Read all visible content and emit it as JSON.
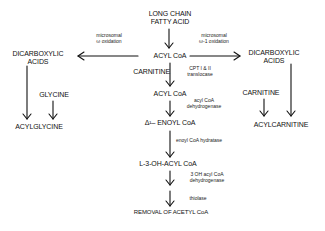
{
  "diagram": {
    "nodes": {
      "source": "LONG CHAIN\nFATTY ACID",
      "source_line1": "LONG CHAIN",
      "source_line2": "FATTY ACID",
      "acyl_coa_1": "ACYL CoA",
      "carnitine_center": "CARNITINE",
      "acyl_coa_2": "ACYL CoA",
      "enoyl_coa": "Δ¹– ENOYL CoA",
      "hydroxyacyl_coa": "L-3-OH-ACYL CoA",
      "removal": "REMOVAL OF ACETYL CoA",
      "left_dicarboxylic_line1": "DICARBOXYLIC",
      "left_dicarboxylic_line2": "ACIDS",
      "glycine": "GLYCINE",
      "acylglycine": "ACYLGLYCINE",
      "right_dicarboxylic_line1": "DICARBOXYLIC",
      "right_dicarboxylic_line2": "ACIDS",
      "carnitine_right": "CARNITINE",
      "acylcarnitine": "ACYLCARNITINE"
    },
    "enzymes": {
      "omega_line1": "microsomal",
      "omega_line2": "ω oxidation",
      "omega1_line1": "microsomal",
      "omega1_line2": "ω-1 oxidation",
      "cpt_line1": "CPT I & II",
      "cpt_line2": "translocase",
      "acad_line1": "acyl CoA",
      "acad_line2": "dehydrogenase",
      "hydratase": "enoyl CoA hydratase",
      "hadh_line1": "3 OH acyl CoA",
      "hadh_line2": "dehydrogenase",
      "thiolase": "thiolase"
    },
    "edges": [
      {
        "from": "LONG CHAIN FATTY ACID",
        "to": "ACYL CoA"
      },
      {
        "from": "ACYL CoA",
        "to": "DICARBOXYLIC ACIDS (left)",
        "label": "microsomal ω oxidation"
      },
      {
        "from": "ACYL CoA",
        "to": "DICARBOXYLIC ACIDS (right)",
        "label": "microsomal ω-1 oxidation"
      },
      {
        "from": "ACYL CoA",
        "to": "ACYL CoA (mitochondrial)",
        "label": "CPT I & II translocase",
        "cofactor": "CARNITINE"
      },
      {
        "from": "ACYL CoA (mitochondrial)",
        "to": "Δ¹– ENOYL CoA",
        "label": "acyl CoA dehydrogenase"
      },
      {
        "from": "Δ¹– ENOYL CoA",
        "to": "L-3-OH-ACYL CoA",
        "label": "enoyl CoA hydratase"
      },
      {
        "from": "L-3-OH-ACYL CoA",
        "to": "REMOVAL OF ACETYL CoA (via 3 OH acyl CoA dehydrogenase)",
        "label": "3 OH acyl CoA dehydrogenase"
      },
      {
        "from": "REMOVAL step",
        "to": "REMOVAL OF ACETYL CoA",
        "label": "thiolase"
      },
      {
        "from": "DICARBOXYLIC ACIDS (left)",
        "to": "ACYLGLYCINE"
      },
      {
        "from": "GLYCINE",
        "to": "ACYLGLYCINE"
      },
      {
        "from": "DICARBOXYLIC ACIDS (right)",
        "to": "ACYLCARNITINE"
      },
      {
        "from": "CARNITINE",
        "to": "ACYLCARNITINE"
      }
    ]
  }
}
